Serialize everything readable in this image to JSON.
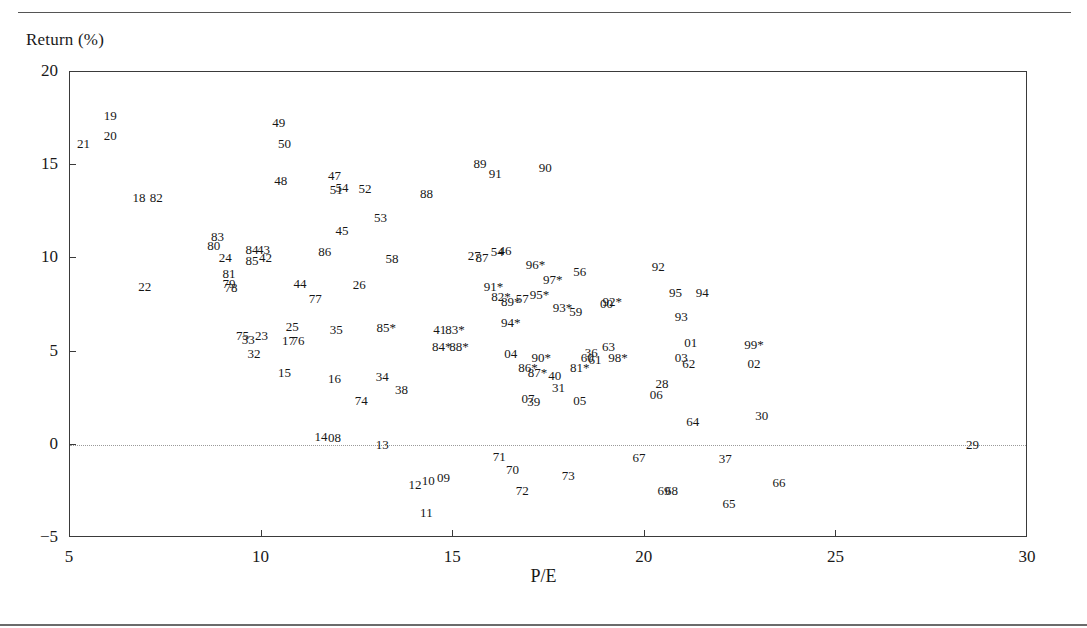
{
  "figure": {
    "title": "",
    "ylabel": "Return (%)",
    "xlabel": "P/E"
  },
  "chart_data": {
    "type": "scatter",
    "title": "",
    "xlabel": "P/E",
    "ylabel": "Return (%)",
    "xlim": [
      5,
      30
    ],
    "ylim": [
      -5,
      20
    ],
    "xticks": [
      5,
      10,
      15,
      20,
      25,
      30
    ],
    "yticks": [
      -5,
      0,
      5,
      10,
      15,
      20
    ],
    "grid": false,
    "legend": "none",
    "annotations": [
      {
        "text": "zero-reference dotted line at Return = 0"
      }
    ],
    "marker_style": "text-labels-only",
    "points": [
      {
        "label": "21",
        "x": 5.35,
        "y": 16.2
      },
      {
        "label": "19",
        "x": 6.05,
        "y": 17.7
      },
      {
        "label": "20",
        "x": 6.05,
        "y": 16.6
      },
      {
        "label": "18",
        "x": 6.8,
        "y": 13.3
      },
      {
        "label": "82",
        "x": 7.25,
        "y": 13.3
      },
      {
        "label": "22",
        "x": 6.95,
        "y": 8.5
      },
      {
        "label": "83",
        "x": 8.85,
        "y": 11.2
      },
      {
        "label": "80",
        "x": 8.75,
        "y": 10.7
      },
      {
        "label": "24",
        "x": 9.05,
        "y": 10.1
      },
      {
        "label": "81",
        "x": 9.15,
        "y": 9.2
      },
      {
        "label": "79",
        "x": 9.15,
        "y": 8.7
      },
      {
        "label": "78",
        "x": 9.2,
        "y": 8.45
      },
      {
        "label": "84",
        "x": 9.75,
        "y": 10.5
      },
      {
        "label": "43",
        "x": 10.05,
        "y": 10.5
      },
      {
        "label": "42",
        "x": 10.1,
        "y": 10.1
      },
      {
        "label": "85",
        "x": 9.75,
        "y": 9.9
      },
      {
        "label": "49",
        "x": 10.45,
        "y": 17.3
      },
      {
        "label": "50",
        "x": 10.6,
        "y": 16.2
      },
      {
        "label": "48",
        "x": 10.5,
        "y": 14.2
      },
      {
        "label": "47",
        "x": 11.9,
        "y": 14.5
      },
      {
        "label": "51",
        "x": 11.95,
        "y": 13.75
      },
      {
        "label": "54",
        "x": 12.1,
        "y": 13.85
      },
      {
        "label": "52",
        "x": 12.7,
        "y": 13.8
      },
      {
        "label": "45",
        "x": 12.1,
        "y": 11.5
      },
      {
        "label": "53",
        "x": 13.1,
        "y": 12.2
      },
      {
        "label": "86",
        "x": 11.65,
        "y": 10.4
      },
      {
        "label": "58",
        "x": 13.4,
        "y": 10.0
      },
      {
        "label": "44",
        "x": 11.0,
        "y": 8.7
      },
      {
        "label": "77",
        "x": 11.4,
        "y": 7.9
      },
      {
        "label": "26",
        "x": 12.55,
        "y": 8.6
      },
      {
        "label": "25",
        "x": 10.8,
        "y": 6.4
      },
      {
        "label": "17",
        "x": 10.7,
        "y": 5.6
      },
      {
        "label": "76",
        "x": 10.95,
        "y": 5.6
      },
      {
        "label": "35",
        "x": 11.95,
        "y": 6.2
      },
      {
        "label": "75",
        "x": 9.5,
        "y": 5.9
      },
      {
        "label": "33",
        "x": 9.65,
        "y": 5.7
      },
      {
        "label": "23",
        "x": 10.0,
        "y": 5.9
      },
      {
        "label": "32",
        "x": 9.8,
        "y": 4.9
      },
      {
        "label": "15",
        "x": 10.6,
        "y": 3.9
      },
      {
        "label": "16",
        "x": 11.9,
        "y": 3.6
      },
      {
        "label": "34",
        "x": 13.15,
        "y": 3.7
      },
      {
        "label": "38",
        "x": 13.65,
        "y": 3.0
      },
      {
        "label": "74",
        "x": 12.6,
        "y": 2.4
      },
      {
        "label": "14",
        "x": 11.55,
        "y": 0.45
      },
      {
        "label": "08",
        "x": 11.9,
        "y": 0.4
      },
      {
        "label": "13",
        "x": 13.15,
        "y": 0.05
      },
      {
        "label": "85*",
        "x": 13.25,
        "y": 6.3
      },
      {
        "label": "41",
        "x": 14.65,
        "y": 6.2
      },
      {
        "label": "83*",
        "x": 15.05,
        "y": 6.2
      },
      {
        "label": "84*",
        "x": 14.7,
        "y": 5.3
      },
      {
        "label": "88*",
        "x": 15.15,
        "y": 5.3
      },
      {
        "label": "89",
        "x": 15.7,
        "y": 15.1
      },
      {
        "label": "91",
        "x": 16.1,
        "y": 14.6
      },
      {
        "label": "90",
        "x": 17.4,
        "y": 14.9
      },
      {
        "label": "88",
        "x": 14.3,
        "y": 13.5
      },
      {
        "label": "27",
        "x": 15.55,
        "y": 10.2
      },
      {
        "label": "87",
        "x": 15.75,
        "y": 10.1
      },
      {
        "label": "54",
        "x": 16.15,
        "y": 10.4
      },
      {
        "label": "46",
        "x": 16.35,
        "y": 10.45
      },
      {
        "label": "96*",
        "x": 17.15,
        "y": 9.7
      },
      {
        "label": "56",
        "x": 18.3,
        "y": 9.3
      },
      {
        "label": "97*",
        "x": 17.6,
        "y": 8.9
      },
      {
        "label": "91*",
        "x": 16.05,
        "y": 8.5
      },
      {
        "label": "82*",
        "x": 16.25,
        "y": 8.0
      },
      {
        "label": "89*",
        "x": 16.5,
        "y": 7.7
      },
      {
        "label": "57",
        "x": 16.8,
        "y": 7.9
      },
      {
        "label": "95*",
        "x": 17.25,
        "y": 8.1
      },
      {
        "label": "93*",
        "x": 17.85,
        "y": 7.4
      },
      {
        "label": "59",
        "x": 18.2,
        "y": 7.2
      },
      {
        "label": "00",
        "x": 19.0,
        "y": 7.6
      },
      {
        "label": "92*",
        "x": 19.15,
        "y": 7.7
      },
      {
        "label": "94*",
        "x": 16.5,
        "y": 6.6
      },
      {
        "label": "04",
        "x": 16.5,
        "y": 4.9
      },
      {
        "label": "90*",
        "x": 17.3,
        "y": 4.7
      },
      {
        "label": "86*",
        "x": 16.95,
        "y": 4.2
      },
      {
        "label": "87*",
        "x": 17.2,
        "y": 3.9
      },
      {
        "label": "40",
        "x": 17.65,
        "y": 3.75
      },
      {
        "label": "81*",
        "x": 18.3,
        "y": 4.2
      },
      {
        "label": "36",
        "x": 18.6,
        "y": 5.0
      },
      {
        "label": "60",
        "x": 18.5,
        "y": 4.7
      },
      {
        "label": "61",
        "x": 18.7,
        "y": 4.6
      },
      {
        "label": "63",
        "x": 19.05,
        "y": 5.3
      },
      {
        "label": "98*",
        "x": 19.3,
        "y": 4.7
      },
      {
        "label": "31",
        "x": 17.75,
        "y": 3.1
      },
      {
        "label": "07",
        "x": 16.95,
        "y": 2.5
      },
      {
        "label": "39",
        "x": 17.1,
        "y": 2.35
      },
      {
        "label": "05",
        "x": 18.3,
        "y": 2.4
      },
      {
        "label": "92",
        "x": 20.35,
        "y": 9.6
      },
      {
        "label": "95",
        "x": 20.8,
        "y": 8.2
      },
      {
        "label": "94",
        "x": 21.5,
        "y": 8.2
      },
      {
        "label": "93",
        "x": 20.95,
        "y": 6.9
      },
      {
        "label": "01",
        "x": 21.2,
        "y": 5.5
      },
      {
        "label": "03",
        "x": 20.95,
        "y": 4.7
      },
      {
        "label": "62",
        "x": 21.15,
        "y": 4.4
      },
      {
        "label": "99*",
        "x": 22.85,
        "y": 5.4
      },
      {
        "label": "02",
        "x": 22.85,
        "y": 4.4
      },
      {
        "label": "28",
        "x": 20.45,
        "y": 3.3
      },
      {
        "label": "06",
        "x": 20.3,
        "y": 2.7
      },
      {
        "label": "64",
        "x": 21.25,
        "y": 1.3
      },
      {
        "label": "30",
        "x": 23.05,
        "y": 1.6
      },
      {
        "label": "29",
        "x": 28.55,
        "y": 0.05
      },
      {
        "label": "71",
        "x": 16.2,
        "y": -0.6
      },
      {
        "label": "70",
        "x": 16.55,
        "y": -1.3
      },
      {
        "label": "12",
        "x": 14.0,
        "y": -2.1
      },
      {
        "label": "10",
        "x": 14.35,
        "y": -1.9
      },
      {
        "label": "09",
        "x": 14.75,
        "y": -1.75
      },
      {
        "label": "11",
        "x": 14.3,
        "y": -3.6
      },
      {
        "label": "72",
        "x": 16.8,
        "y": -2.4
      },
      {
        "label": "73",
        "x": 18.0,
        "y": -1.6
      },
      {
        "label": "67",
        "x": 19.85,
        "y": -0.65
      },
      {
        "label": "37",
        "x": 22.1,
        "y": -0.7
      },
      {
        "label": "69",
        "x": 20.5,
        "y": -2.4
      },
      {
        "label": "68",
        "x": 20.7,
        "y": -2.4
      },
      {
        "label": "65",
        "x": 22.2,
        "y": -3.1
      },
      {
        "label": "66",
        "x": 23.5,
        "y": -2.0
      }
    ]
  }
}
